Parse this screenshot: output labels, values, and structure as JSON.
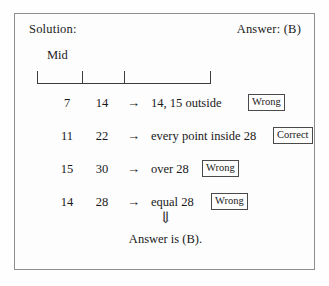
{
  "header": {
    "solution_label": "Solution:",
    "answer_label": "Answer: (B)"
  },
  "number_line": {
    "mid_label": "Mid",
    "tick_positions_pct": [
      0,
      26,
      50,
      100
    ],
    "tick_count": 4
  },
  "rows": [
    {
      "value_a": "7",
      "value_b": "14",
      "arrow": "→",
      "description": "14, 15 outside",
      "verdict": "Wrong",
      "verdict_left": "233px"
    },
    {
      "value_a": "11",
      "value_b": "22",
      "arrow": "→",
      "description": "every point inside 28",
      "verdict": "Correct",
      "verdict_left": "258px"
    },
    {
      "value_a": "15",
      "value_b": "30",
      "arrow": "→",
      "description": "over 28",
      "verdict": "Wrong",
      "verdict_left": "187px"
    },
    {
      "value_a": "14",
      "value_b": "28",
      "arrow": "→",
      "description": "equal 28",
      "verdict": "Wrong",
      "verdict_left": "196px"
    }
  ],
  "conclusion": {
    "implication_arrow": "⇓",
    "final_text": "Answer is (B)."
  },
  "colors": {
    "border": "#8e8e8e",
    "ink": "#1a1a1a",
    "rule": "#3c3c3c",
    "box": "#4a4a4a",
    "background": "#fdfdfd"
  }
}
